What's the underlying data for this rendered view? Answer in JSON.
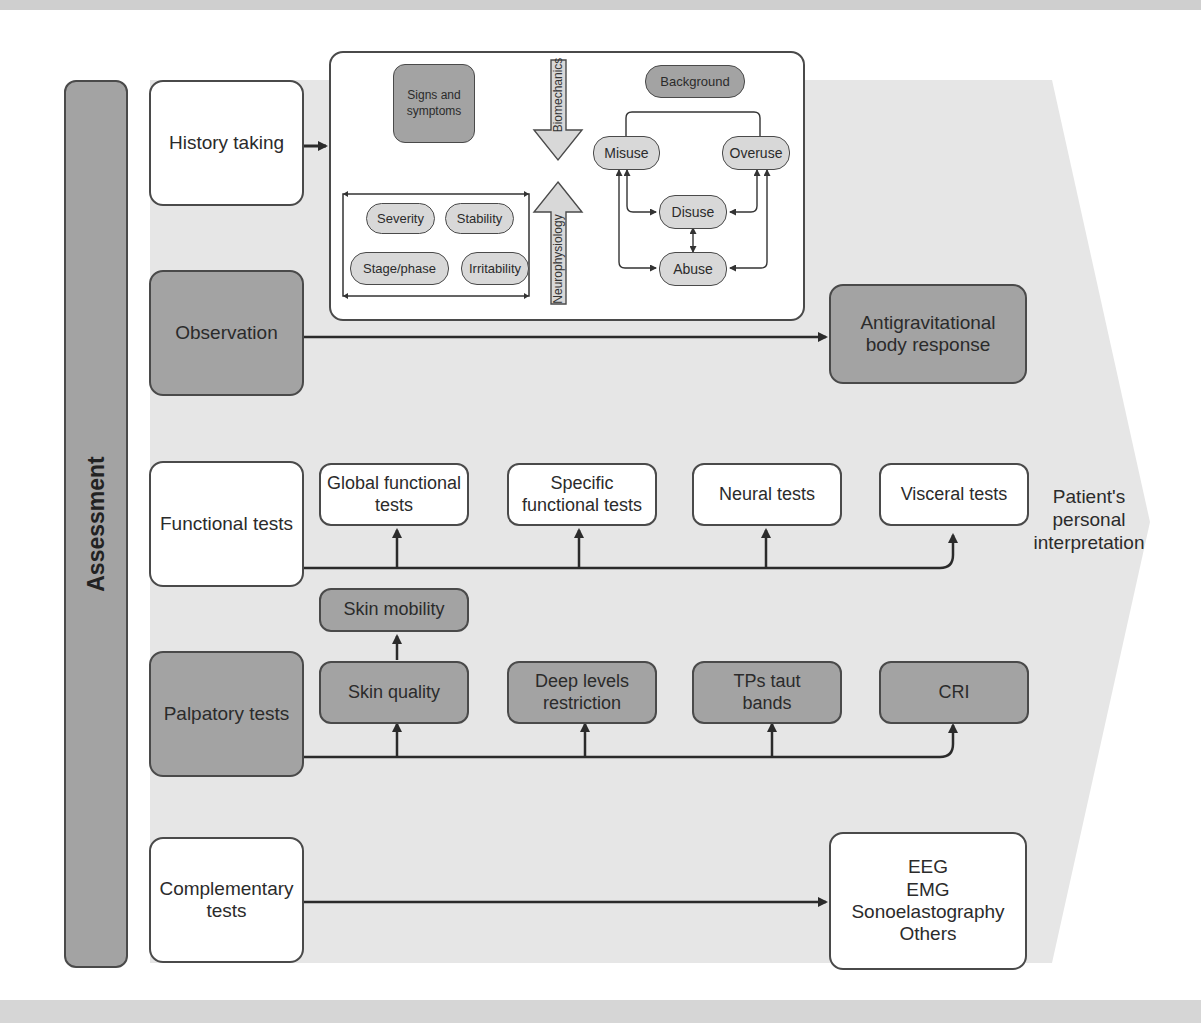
{
  "title": "Assessment",
  "colors": {
    "dark_box": "#a3a3a3",
    "light_pill": "#d8d8d8",
    "chevron_bg": "#e6e6e6",
    "stroke": "#4a4a4a",
    "white_box": "#ffffff"
  },
  "rows": {
    "history": {
      "label": "History taking"
    },
    "observation": {
      "label": "Observation",
      "target": "Antigravitational body response"
    },
    "functional": {
      "label": "Functional tests",
      "targets": [
        "Global functional tests",
        "Specific functional tests",
        "Neural tests",
        "Visceral tests"
      ]
    },
    "palpatory": {
      "label": "Palpatory tests",
      "skin_mobility": "Skin mobility",
      "targets": [
        "Skin quality",
        "Deep levels restriction",
        "TPs taut bands",
        "CRI"
      ]
    },
    "complementary": {
      "label": "Complementary tests",
      "target_lines": [
        "EEG",
        "EMG",
        "Sonoelastography",
        "Others"
      ]
    }
  },
  "history_detail": {
    "signs": "Signs and symptoms",
    "qualifiers": [
      "Severity",
      "Stability",
      "Stage/phase",
      "Irritability"
    ],
    "arrow_down": "Biomechanics",
    "arrow_up": "Neurophysiology",
    "background": "Background",
    "patterns": [
      "Misuse",
      "Overuse",
      "Disuse",
      "Abuse"
    ]
  },
  "outcome": "Patient's personal interpretation"
}
